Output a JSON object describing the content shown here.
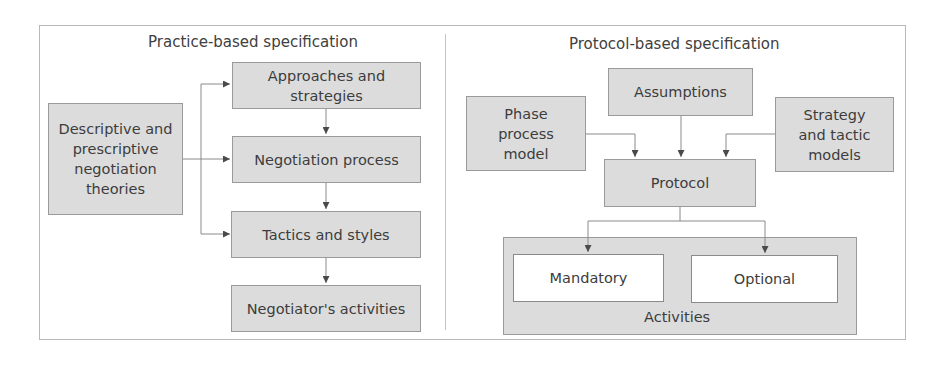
{
  "diagram": {
    "left_panel": {
      "title": "Practice-based specification",
      "source_box": "Descriptive and\nprescriptive\nnegotiation\ntheories",
      "chain": [
        "Approaches and\nstrategies",
        "Negotiation process",
        "Tactics and styles",
        "Negotiator's activities"
      ]
    },
    "right_panel": {
      "title": "Protocol-based specification",
      "assumptions": "Assumptions",
      "phase_model": "Phase\nprocess\nmodel",
      "strategy_models": "Strategy\nand tactic\nmodels",
      "protocol": "Protocol",
      "activities": {
        "label": "Activities",
        "mandatory": "Mandatory",
        "optional": "Optional"
      }
    },
    "colors": {
      "box_fill": "#dcdcdc",
      "box_border": "#9a9a9a",
      "arrow": "#4a4a4a",
      "frame": "#b8b8b8"
    }
  }
}
